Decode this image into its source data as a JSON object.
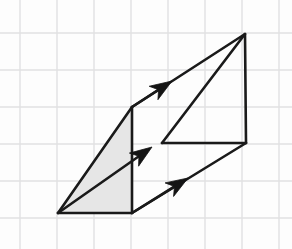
{
  "figure": {
    "title": "Geometric vector figure on graph paper",
    "canvas": {
      "width": 292,
      "height": 249
    },
    "background_color": "#fdfdfd",
    "grid": {
      "visible": true,
      "line_color": "#e0e0e2",
      "line_width": 1.4,
      "cell_size": 37,
      "x_lines": [
        20,
        57,
        94,
        131,
        168,
        205,
        242,
        279
      ],
      "y_lines": [
        33,
        70,
        107,
        144,
        181,
        218
      ]
    },
    "stroke_color": "#1a1a1a",
    "stroke_width": 2.6,
    "shade_color": "#e6e6e6",
    "shade_opacity": 1,
    "points": {
      "origin": {
        "name": "A",
        "x": 58,
        "y": 213
      },
      "front_bottom": {
        "name": "B",
        "x": 132,
        "y": 213
      },
      "front_top": {
        "name": "C",
        "x": 132,
        "y": 107
      },
      "mid_left": {
        "name": "D",
        "x": 162,
        "y": 143
      },
      "right_bottom": {
        "name": "E",
        "x": 246,
        "y": 143
      },
      "apex": {
        "name": "F",
        "x": 245,
        "y": 34
      }
    },
    "shaded_face": {
      "name": "shaded-triangle",
      "vertices": [
        [
          58,
          213
        ],
        [
          132,
          107
        ],
        [
          132,
          213
        ]
      ],
      "fill": "#e6e6e6"
    },
    "edges": [
      {
        "name": "bottom-edge",
        "from": [
          58,
          213
        ],
        "to": [
          132,
          213
        ]
      },
      {
        "name": "front-vertical",
        "from": [
          132,
          107
        ],
        "to": [
          132,
          213
        ]
      },
      {
        "name": "left-upper-diagonal",
        "from": [
          58,
          213
        ],
        "to": [
          132,
          107
        ]
      },
      {
        "name": "top-long-diagonal",
        "from": [
          132,
          107
        ],
        "to": [
          245,
          34
        ]
      },
      {
        "name": "apex-to-mid",
        "from": [
          245,
          34
        ],
        "to": [
          162,
          143
        ]
      },
      {
        "name": "mid-horizontal",
        "from": [
          162,
          143
        ],
        "to": [
          246,
          143
        ]
      },
      {
        "name": "right-vertical",
        "from": [
          245,
          34
        ],
        "to": [
          246,
          143
        ]
      },
      {
        "name": "bottom-right-diagonal",
        "from": [
          132,
          213
        ],
        "to": [
          246,
          143
        ]
      }
    ],
    "arrows": [
      {
        "name": "upper-vector",
        "label": "top arrow",
        "tail": [
          132,
          107
        ],
        "tip": [
          172,
          81
        ],
        "direction": "up-right"
      },
      {
        "name": "middle-vector",
        "label": "middle arrow",
        "tail": [
          58,
          213
        ],
        "tip": [
          152,
          147
        ],
        "direction": "up-right"
      },
      {
        "name": "lower-vector",
        "label": "bottom arrow",
        "tail": [
          132,
          213
        ],
        "tip": [
          188,
          178
        ],
        "direction": "up-right"
      }
    ],
    "arrow_head": {
      "length": 22,
      "half_width": 8,
      "barb_inset": 6,
      "fill": "#141414"
    }
  }
}
